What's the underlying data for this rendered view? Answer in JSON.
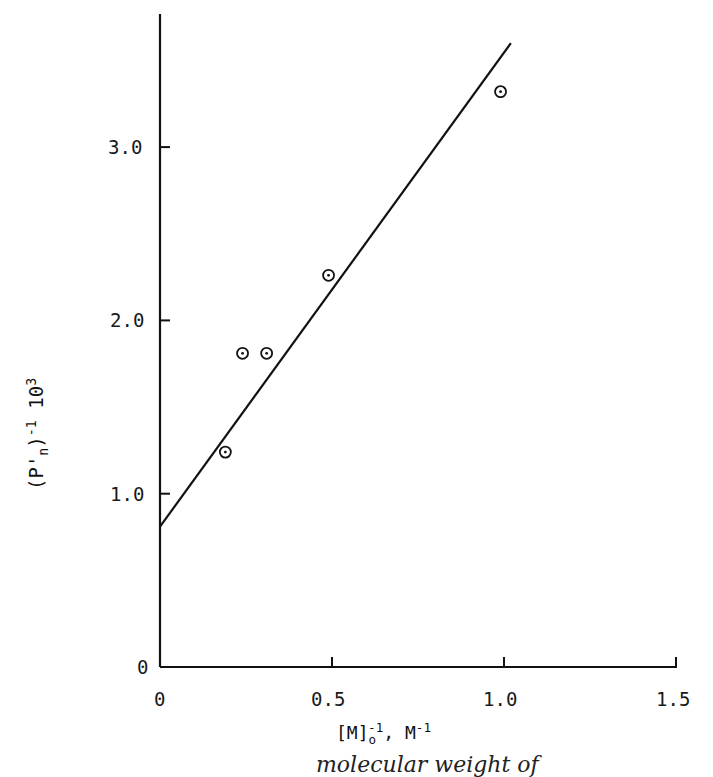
{
  "chart_data": {
    "type": "scatter",
    "title": "",
    "xlabel": "[M]o^-1, M^-1",
    "ylabel": "(P'n)^-1 10^3",
    "xlim": [
      0,
      1.5
    ],
    "ylim": [
      0,
      3.8
    ],
    "x_ticks": [
      "0",
      "0.5",
      "1.0",
      "1.5"
    ],
    "y_ticks": [
      "0",
      "1.0",
      "2.0",
      "3.0"
    ],
    "grid": false,
    "legend": null,
    "series": [
      {
        "name": "data",
        "marker": "circled-dot",
        "x": [
          0.19,
          0.24,
          0.31,
          0.49,
          0.99
        ],
        "y": [
          1.24,
          1.81,
          1.81,
          2.26,
          3.32
        ]
      },
      {
        "name": "fit",
        "type": "line",
        "x": [
          0.0,
          1.02
        ],
        "y": [
          0.81,
          3.6
        ]
      }
    ]
  },
  "labels": {
    "x_tick_0": "0",
    "x_tick_1": "0.5",
    "x_tick_2": "1.0",
    "x_tick_3": "1.5",
    "y_tick_0": "0",
    "y_tick_1": "1.0",
    "y_tick_2": "2.0",
    "y_tick_3": "3.0",
    "x_label_main": "[M]",
    "x_label_sub": "o",
    "x_label_sup": "-1",
    "x_label_rest": ", M",
    "x_label_sup2": "-1",
    "y_label_main": "(P'",
    "y_label_sub": "n",
    "y_label_close": ")",
    "y_label_sup": "-1",
    "y_label_rest": " 10",
    "y_label_sup2": "3",
    "caption_partial": "molecular weight of"
  }
}
